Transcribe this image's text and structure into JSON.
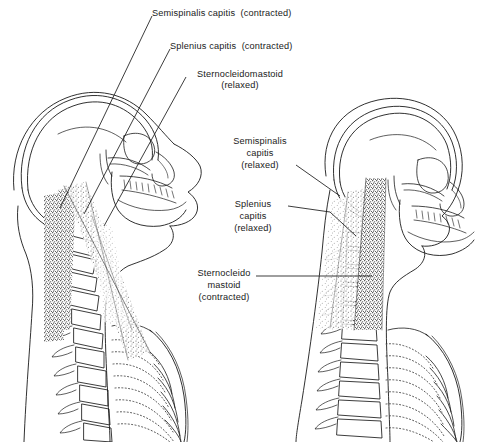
{
  "figure": {
    "background_color": "#ffffff",
    "ink_color": "#1a1a1a",
    "stipple_color": "#3a3a3a"
  },
  "labels": {
    "left_figure": [
      {
        "id": "semispinalis-capitis-contracted",
        "lines": [
          "Semispinalis capitis  (contracted)"
        ],
        "align": "left",
        "x": 152,
        "y": 8
      },
      {
        "id": "splenius-capitis-contracted",
        "lines": [
          "Splenius capitis  (contracted)"
        ],
        "align": "left",
        "x": 170,
        "y": 41
      },
      {
        "id": "sternocleidomastoid-relaxed",
        "lines": [
          "Sternocleidomastoid",
          "(relaxed)"
        ],
        "align": "center",
        "x": 190,
        "y": 69
      }
    ],
    "right_figure": [
      {
        "id": "semispinalis-capitis-relaxed",
        "lines": [
          "Semispinalis",
          "capitis",
          "(relaxed)"
        ],
        "align": "center",
        "x": 234,
        "y": 136
      },
      {
        "id": "splenius-capitis-relaxed",
        "lines": [
          "Splenius",
          "capitis",
          "(relaxed)"
        ],
        "align": "center",
        "x": 248,
        "y": 199
      },
      {
        "id": "sternocleidomastoid-contracted",
        "lines": [
          "Sternocleido",
          "mastoid",
          "(contracted)"
        ],
        "align": "center",
        "x": 195,
        "y": 268
      }
    ]
  },
  "anatomy": {
    "muscles": [
      {
        "name": "semispinalis capitis",
        "figure": "left",
        "state": "contracted"
      },
      {
        "name": "splenius capitis",
        "figure": "left",
        "state": "contracted"
      },
      {
        "name": "sternocleidomastoid",
        "figure": "left",
        "state": "relaxed"
      },
      {
        "name": "semispinalis capitis",
        "figure": "right",
        "state": "relaxed"
      },
      {
        "name": "splenius capitis",
        "figure": "right",
        "state": "relaxed"
      },
      {
        "name": "sternocleidomastoid",
        "figure": "right",
        "state": "contracted"
      }
    ],
    "structures": [
      "cranium",
      "mandible",
      "maxillary teeth",
      "orbit",
      "cervical vertebrae",
      "thoracic vertebrae",
      "ribs",
      "sternum"
    ]
  }
}
